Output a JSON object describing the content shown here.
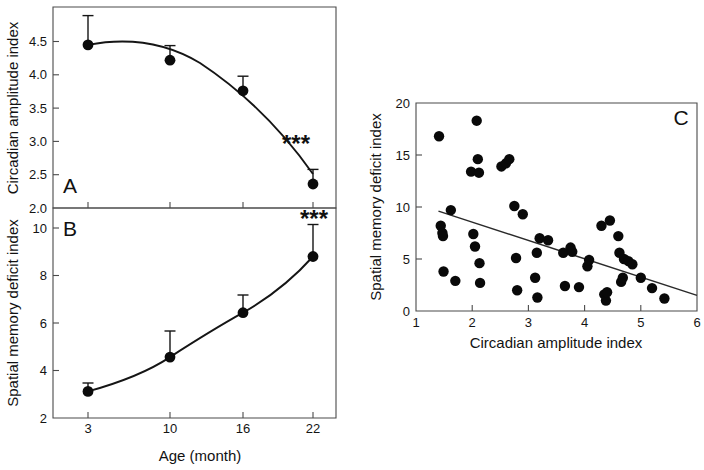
{
  "figure": {
    "title": "",
    "background_color": "#ffffff",
    "ink_color": "#111111"
  },
  "panelA": {
    "letter": "A",
    "significance": "***",
    "ylabel": "Circadian amplitude index",
    "xlabel": "Age (month)",
    "ytick_labels": [
      "4.5",
      "4.0",
      "3.5",
      "3.0",
      "2.5",
      "2.0"
    ],
    "xtick_labels": [
      "3",
      "10",
      "16",
      "22"
    ]
  },
  "panelB": {
    "letter": "B",
    "significance": "***",
    "ylabel": "Spatial memory deficit index",
    "xlabel": "Age (month)",
    "ytick_labels": [
      "10",
      "8",
      "6",
      "4",
      "2"
    ],
    "xtick_labels": [
      "3",
      "10",
      "16",
      "22"
    ]
  },
  "panelC": {
    "letter": "C",
    "ylabel": "Spatial memory deficit index",
    "xlabel": "Circadian amplitude index",
    "ytick_labels": [
      "20",
      "15",
      "10",
      "5",
      "0"
    ],
    "xtick_labels": [
      "1",
      "2",
      "3",
      "4",
      "5",
      "6"
    ]
  },
  "chart_data": [
    {
      "type": "line",
      "panel": "A",
      "title": "",
      "xlabel": "Age (month)",
      "ylabel": "Circadian amplitude index",
      "categories": [
        "3",
        "10",
        "16",
        "22"
      ],
      "x": [
        3,
        10,
        16,
        22
      ],
      "values": [
        4.34,
        4.11,
        3.65,
        2.25
      ],
      "errors_upper": [
        0.44,
        0.22,
        0.22,
        0.22
      ],
      "errors_lower": [
        0,
        0,
        0,
        0
      ],
      "xlim": [
        1.2,
        24.5
      ],
      "ylim": [
        2.0,
        4.8
      ],
      "ytick_values": [
        4.5,
        4.0,
        3.5,
        3.0,
        2.5,
        2.0
      ],
      "xtick_values": [
        3,
        10,
        16,
        22
      ],
      "grid": false,
      "legend": "none",
      "annotations": [
        {
          "text": "A",
          "position": "bottom-left"
        },
        {
          "text": "***",
          "position": "bottom-right"
        }
      ]
    },
    {
      "type": "line",
      "panel": "B",
      "title": "",
      "xlabel": "Age (month)",
      "ylabel": "Spatial memory deficit index",
      "categories": [
        "3",
        "10",
        "16",
        "22"
      ],
      "x": [
        3,
        10,
        16,
        22
      ],
      "values": [
        2.9,
        4.33,
        6.2,
        8.65
      ],
      "errors_upper": [
        0.35,
        1.1,
        0.75,
        1.35
      ],
      "errors_lower": [
        0,
        0,
        0,
        0
      ],
      "xlim": [
        1.2,
        24.5
      ],
      "ylim": [
        2,
        10.5
      ],
      "ytick_values": [
        10,
        8,
        6,
        4,
        2
      ],
      "xtick_values": [
        3,
        10,
        16,
        22
      ],
      "grid": false,
      "legend": "none",
      "annotations": [
        {
          "text": "B",
          "position": "top-left"
        },
        {
          "text": "***",
          "position": "top-right"
        }
      ]
    },
    {
      "type": "scatter",
      "panel": "C",
      "title": "",
      "xlabel": "Circadian amplitude index",
      "ylabel": "Spatial memory deficit index",
      "xlim": [
        1,
        6
      ],
      "ylim": [
        0,
        20
      ],
      "ytick_values": [
        0,
        5,
        10,
        15,
        20
      ],
      "xtick_values": [
        1,
        2,
        3,
        4,
        5,
        6
      ],
      "grid": false,
      "legend": "none",
      "points": [
        [
          1.41,
          16.8
        ],
        [
          1.44,
          8.2
        ],
        [
          1.47,
          7.5
        ],
        [
          1.48,
          7.2
        ],
        [
          1.49,
          3.8
        ],
        [
          1.62,
          9.7
        ],
        [
          1.7,
          2.9
        ],
        [
          1.98,
          13.4
        ],
        [
          2.02,
          7.4
        ],
        [
          2.05,
          6.2
        ],
        [
          2.08,
          18.3
        ],
        [
          2.1,
          14.6
        ],
        [
          2.12,
          13.3
        ],
        [
          2.13,
          4.6
        ],
        [
          2.14,
          2.7
        ],
        [
          2.52,
          13.9
        ],
        [
          2.6,
          14.2
        ],
        [
          2.66,
          14.6
        ],
        [
          2.75,
          10.1
        ],
        [
          2.78,
          5.1
        ],
        [
          2.8,
          2.0
        ],
        [
          2.9,
          9.3
        ],
        [
          3.12,
          3.2
        ],
        [
          3.15,
          5.6
        ],
        [
          3.16,
          1.3
        ],
        [
          3.2,
          7.0
        ],
        [
          3.35,
          6.8
        ],
        [
          3.62,
          5.6
        ],
        [
          3.65,
          2.4
        ],
        [
          3.75,
          6.1
        ],
        [
          3.78,
          5.7
        ],
        [
          3.9,
          2.3
        ],
        [
          4.05,
          4.3
        ],
        [
          4.08,
          4.9
        ],
        [
          4.3,
          8.2
        ],
        [
          4.35,
          1.6
        ],
        [
          4.38,
          1.0
        ],
        [
          4.4,
          1.8
        ],
        [
          4.45,
          8.7
        ],
        [
          4.6,
          7.2
        ],
        [
          4.62,
          5.6
        ],
        [
          4.65,
          2.8
        ],
        [
          4.68,
          3.2
        ],
        [
          4.7,
          5.0
        ],
        [
          4.78,
          4.8
        ],
        [
          4.85,
          4.5
        ],
        [
          5.0,
          3.2
        ],
        [
          5.2,
          2.2
        ],
        [
          5.42,
          1.2
        ]
      ],
      "regression_line": {
        "x0": 1.4,
        "y0": 9.6,
        "x1": 6.0,
        "y1": 1.5
      },
      "annotations": [
        {
          "text": "C",
          "position": "top-right"
        }
      ]
    }
  ]
}
